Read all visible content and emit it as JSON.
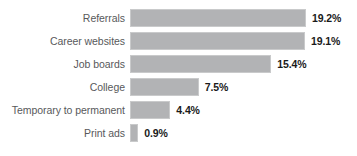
{
  "chart_data": {
    "type": "bar",
    "orientation": "horizontal",
    "title": "",
    "subtitle": "",
    "xlabel": "",
    "ylabel": "",
    "grid": false,
    "legend": null,
    "axis_visible": false,
    "xlim": [
      0,
      19.2
    ],
    "categories": [
      "Referrals",
      "Career websites",
      "Job boards",
      "College",
      "Temporary to permanent",
      "Print ads"
    ],
    "values": [
      19.2,
      19.1,
      15.4,
      7.5,
      4.4,
      0.9
    ],
    "value_labels": [
      "19.2%",
      "19.1%",
      "15.4%",
      "7.5%",
      "4.4%",
      "0.9%"
    ],
    "bar_color": "#b2b3b5",
    "bar_border_color": "#c9cacb",
    "label_color": "#58595b",
    "value_color": "#1a1a1a",
    "background": "#ffffff"
  }
}
